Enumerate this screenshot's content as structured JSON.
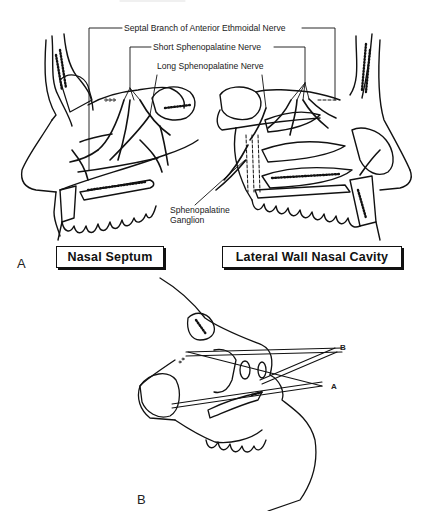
{
  "figure": {
    "panels": [
      {
        "letter": "A",
        "labels": {
          "septal_branch": "Septal Branch of Anterior Ethmoidal Nerve",
          "short_sphenopalatine": "Short Sphenopalatine Nerve",
          "long_sphenopalatine": "Long Sphenopalatine Nerve",
          "ganglion_line1": "Sphenopalatine",
          "ganglion_line2": "Ganglion"
        },
        "boxed_captions": {
          "left": "Nasal Septum",
          "right": "Lateral Wall Nasal Cavity"
        }
      },
      {
        "letter": "B",
        "labels": {
          "probe_b": "B",
          "probe_a": "A"
        }
      }
    ],
    "colors": {
      "ink": "#111111",
      "background": "#ffffff"
    }
  }
}
